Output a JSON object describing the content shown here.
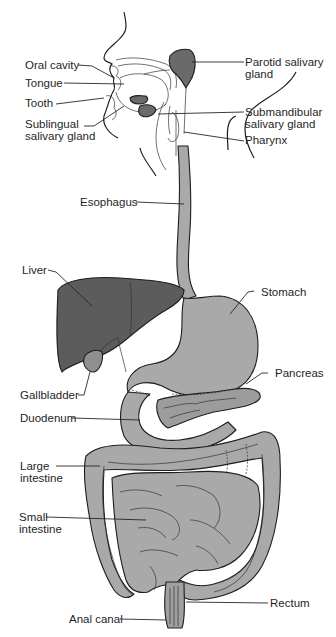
{
  "diagram": {
    "title_partial": "Digestive System",
    "colors": {
      "background": "#ffffff",
      "light_organ_fill": "#a9a9a9",
      "liver_fill": "#5c5c5c",
      "gland_fill": "#6a6a6a",
      "outline": "#1e1e1e",
      "label_text": "#1f1f1f"
    },
    "labels": {
      "oral_cavity": "Oral cavity",
      "tongue": "Tongue",
      "tooth": "Tooth",
      "sublingual": "Sublingual\nsalivary gland",
      "parotid": "Parotid salivary\ngland",
      "submandibular": "Submandibular\nsalivary gland",
      "pharynx": "Pharynx",
      "esophagus": "Esophagus",
      "liver": "Liver",
      "stomach": "Stomach",
      "pancreas": "Pancreas",
      "gallbladder": "Gallbladder",
      "duodenum": "Duodenum",
      "large_intestine": "Large\nintestine",
      "small_intestine": "Small\nintestine",
      "rectum": "Rectum",
      "anal_canal": "Anal canal"
    }
  }
}
